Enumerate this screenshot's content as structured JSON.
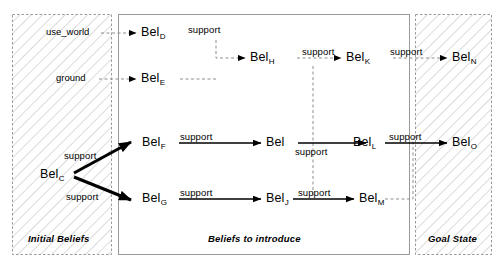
{
  "diagram": {
    "panels": [
      {
        "id": "initial",
        "caption": "Initial Beliefs",
        "hatched": true
      },
      {
        "id": "introduce",
        "caption": "Beliefs to introduce",
        "hatched": false
      },
      {
        "id": "goal",
        "caption": "Goal State",
        "hatched": true
      }
    ],
    "terms": [
      {
        "id": "use_world",
        "label": "use_world"
      },
      {
        "id": "ground",
        "label": "ground"
      }
    ],
    "nodes": [
      {
        "id": "belD",
        "base": "Bel",
        "sub": "D",
        "panel": "introduce"
      },
      {
        "id": "belE",
        "base": "Bel",
        "sub": "E",
        "panel": "introduce"
      },
      {
        "id": "belH",
        "base": "Bel",
        "sub": "H",
        "panel": "introduce"
      },
      {
        "id": "belK",
        "base": "Bel",
        "sub": "K",
        "panel": "introduce"
      },
      {
        "id": "belN",
        "base": "Bel",
        "sub": "N",
        "panel": "goal"
      },
      {
        "id": "belC",
        "base": "Bel",
        "sub": "C",
        "panel": "initial"
      },
      {
        "id": "belF",
        "base": "Bel",
        "sub": "F",
        "panel": "introduce"
      },
      {
        "id": "belI",
        "base": "Bel",
        "sub": "",
        "panel": "introduce"
      },
      {
        "id": "belL",
        "base": "Bel",
        "sub": "L",
        "panel": "introduce"
      },
      {
        "id": "belO",
        "base": "Bel",
        "sub": "O",
        "panel": "goal"
      },
      {
        "id": "belG",
        "base": "Bel",
        "sub": "G",
        "panel": "introduce"
      },
      {
        "id": "belJ",
        "base": "Bel",
        "sub": "J",
        "panel": "introduce"
      },
      {
        "id": "belM",
        "base": "Bel",
        "sub": "M",
        "panel": "introduce"
      }
    ],
    "edge_labels": {
      "support": "support"
    },
    "edges": [
      {
        "from": "use_world",
        "to": "belD",
        "label": "",
        "style": "dashed"
      },
      {
        "from": "ground",
        "to": "belE",
        "label": "",
        "style": "dashed"
      },
      {
        "from": "belD",
        "to": "belH",
        "label": "support",
        "style": "dashed"
      },
      {
        "from": "belE",
        "to": "belH",
        "label": "",
        "style": "dashed"
      },
      {
        "from": "belH",
        "to": "belK",
        "label": "support",
        "style": "dashed"
      },
      {
        "from": "belK",
        "to": "belN",
        "label": "support",
        "style": "dashed"
      },
      {
        "from": "belC",
        "to": "belF",
        "label": "support",
        "style": "bold"
      },
      {
        "from": "belC",
        "to": "belG",
        "label": "support",
        "style": "bold"
      },
      {
        "from": "belF",
        "to": "belI",
        "label": "support",
        "style": "solid"
      },
      {
        "from": "belI",
        "to": "belL",
        "label": "support",
        "style": "solid"
      },
      {
        "from": "belL",
        "to": "belO",
        "label": "support",
        "style": "solid"
      },
      {
        "from": "belG",
        "to": "belJ",
        "label": "support",
        "style": "solid"
      },
      {
        "from": "belJ",
        "to": "belM",
        "label": "support",
        "style": "solid"
      }
    ],
    "colors": {
      "ink": "#000000",
      "hatch": "#b8b8b8",
      "panel_border": "#9a9a9a",
      "background": "#ffffff"
    }
  }
}
